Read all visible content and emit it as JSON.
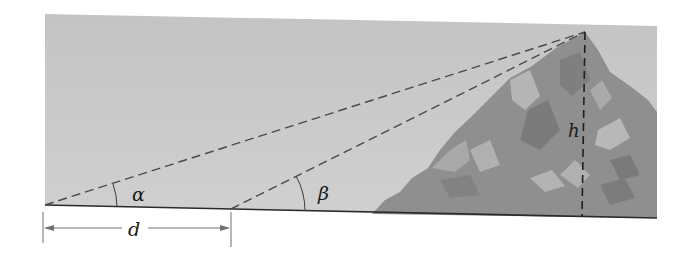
{
  "diagram": {
    "title": "",
    "labels": {
      "alpha": "α",
      "beta": "β",
      "height": "h",
      "distance": "d"
    },
    "colors": {
      "sky": "#c9c9c9",
      "mountain_base": "#8e8e8e",
      "mountain_dark": "#7a7a7a",
      "mountain_light": "#b2b2b2",
      "line": "#3a3a3a",
      "dimension": "#6a6a6a"
    }
  }
}
